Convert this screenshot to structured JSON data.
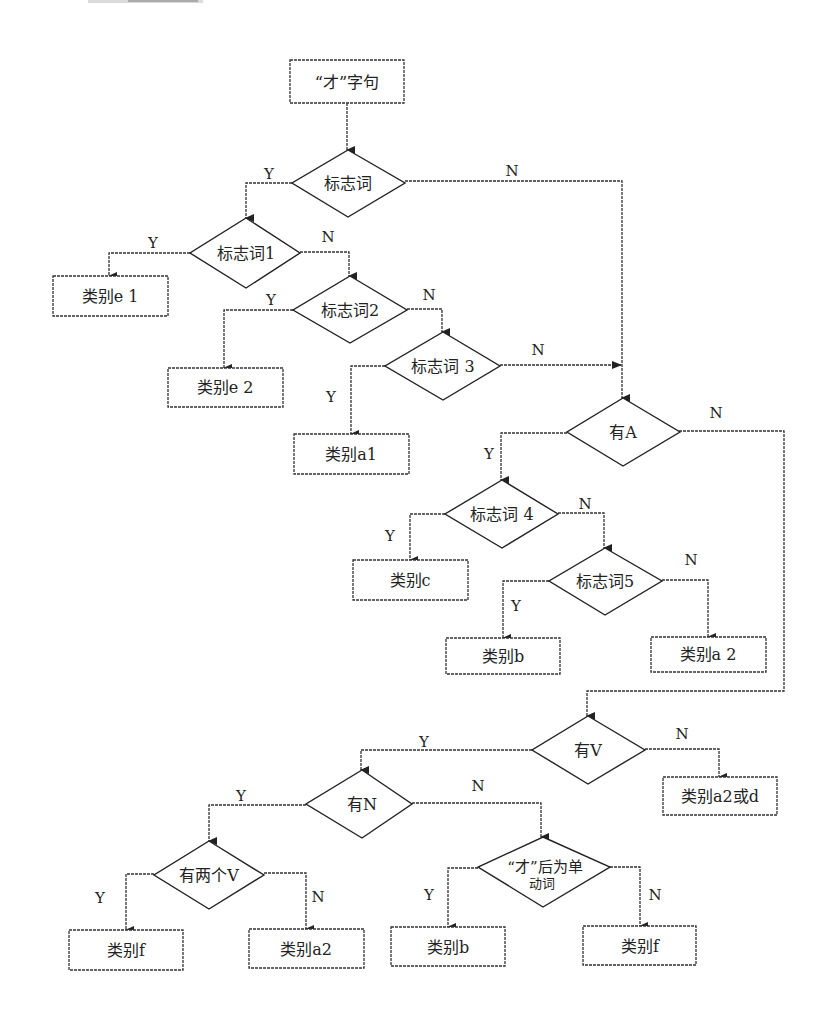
{
  "diagram": {
    "type": "flowchart",
    "start": {
      "id": "start",
      "label": "“才”字句"
    },
    "decisions": [
      {
        "id": "d0",
        "label": "标志词"
      },
      {
        "id": "d1",
        "label": "标志词1"
      },
      {
        "id": "d2",
        "label": "标志词2"
      },
      {
        "id": "d3",
        "label": "标志词 3"
      },
      {
        "id": "dA",
        "label": "有A"
      },
      {
        "id": "d4",
        "label": "标志词 4"
      },
      {
        "id": "d5",
        "label": "标志词5"
      },
      {
        "id": "dV",
        "label": "有V"
      },
      {
        "id": "dN",
        "label": "有N"
      },
      {
        "id": "d2V",
        "label": "有两个V"
      },
      {
        "id": "dSingle",
        "label_line1": "“才”后为单",
        "label_line2": "动词"
      }
    ],
    "outcomes": [
      {
        "id": "e1",
        "label": "类别e 1"
      },
      {
        "id": "e2",
        "label": "类别e 2"
      },
      {
        "id": "a1",
        "label": "类别a1"
      },
      {
        "id": "c",
        "label": "类别c"
      },
      {
        "id": "b1",
        "label": "类别b"
      },
      {
        "id": "a2_1",
        "label": "类别a 2"
      },
      {
        "id": "a2d",
        "label": "类别a2或d"
      },
      {
        "id": "f1",
        "label": "类别f"
      },
      {
        "id": "a2_2",
        "label": "类别a2"
      },
      {
        "id": "b2",
        "label": "类别b"
      },
      {
        "id": "f2",
        "label": "类别f"
      }
    ],
    "branch_labels": {
      "yes": "Y",
      "no": "N"
    },
    "edges": [
      {
        "from": "start",
        "to": "d0"
      },
      {
        "from": "d0",
        "to": "d1",
        "label": "Y"
      },
      {
        "from": "d0",
        "to": "dA",
        "label": "N"
      },
      {
        "from": "d1",
        "to": "e1",
        "label": "Y"
      },
      {
        "from": "d1",
        "to": "d2",
        "label": "N"
      },
      {
        "from": "d2",
        "to": "e2",
        "label": "Y"
      },
      {
        "from": "d2",
        "to": "d3",
        "label": "N"
      },
      {
        "from": "d3",
        "to": "a1",
        "label": "Y"
      },
      {
        "from": "d3",
        "to": "dA",
        "label": "N"
      },
      {
        "from": "dA",
        "to": "d4",
        "label": "Y"
      },
      {
        "from": "dA",
        "to": "dV",
        "label": "N"
      },
      {
        "from": "d4",
        "to": "c",
        "label": "Y"
      },
      {
        "from": "d4",
        "to": "d5",
        "label": "N"
      },
      {
        "from": "d5",
        "to": "b1",
        "label": "Y"
      },
      {
        "from": "d5",
        "to": "a2_1",
        "label": "N"
      },
      {
        "from": "dV",
        "to": "dN",
        "label": "Y"
      },
      {
        "from": "dV",
        "to": "a2d",
        "label": "N"
      },
      {
        "from": "dN",
        "to": "d2V",
        "label": "Y"
      },
      {
        "from": "dN",
        "to": "dSingle",
        "label": "N"
      },
      {
        "from": "d2V",
        "to": "f1",
        "label": "Y"
      },
      {
        "from": "d2V",
        "to": "a2_2",
        "label": "N"
      },
      {
        "from": "dSingle",
        "to": "b2",
        "label": "Y"
      },
      {
        "from": "dSingle",
        "to": "f2",
        "label": "N"
      }
    ]
  }
}
